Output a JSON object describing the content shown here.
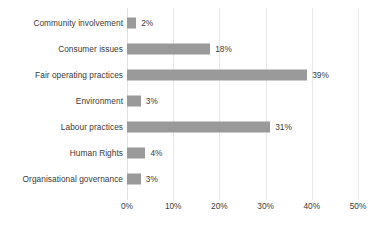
{
  "chart_data": {
    "type": "bar",
    "orientation": "horizontal",
    "title": "",
    "xlabel": "",
    "ylabel": "",
    "xlim": [
      0,
      50
    ],
    "xticks": [
      "0%",
      "10%",
      "20%",
      "30%",
      "40%",
      "50%"
    ],
    "xtick_values": [
      0,
      10,
      20,
      30,
      40,
      50
    ],
    "grid": "vertical",
    "legend": "none",
    "bar_color": "#9a9a9a",
    "text_color": "#3a3a3a",
    "gridline_color": "#e8e8e8",
    "categories": [
      "Community involvement",
      "Consumer issues",
      "Fair operating practices",
      "Environment",
      "Labour practices",
      "Human Rights",
      "Organisational governance"
    ],
    "values": [
      2,
      18,
      39,
      3,
      31,
      4,
      3
    ],
    "value_labels": [
      "2%",
      "18%",
      "39%",
      "3%",
      "31%",
      "4%",
      "3%"
    ]
  }
}
